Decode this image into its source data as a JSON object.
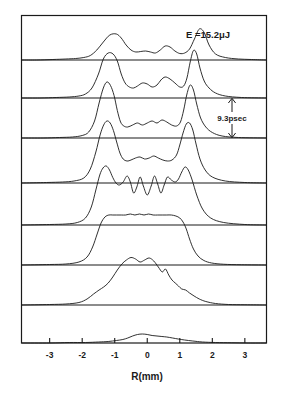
{
  "figure": {
    "energy_label": "E =15.2μJ",
    "interval_label": "9.3psec",
    "xaxis": {
      "title": "R(mm)",
      "ticks": [
        -3,
        -2,
        -1,
        0,
        1,
        2,
        3
      ],
      "tick_labels": [
        "-3",
        "-2",
        "-1",
        "0",
        "1",
        "2",
        "3"
      ],
      "range": [
        -3.85,
        3.65
      ]
    },
    "colors": {
      "ink": "#1a1a1a",
      "background": "#ffffff"
    }
  },
  "chart_data": {
    "type": "line",
    "title": "",
    "subtitle": "",
    "xlabel": "R(mm)",
    "ylabel": "",
    "xlim": [
      -3.85,
      3.65
    ],
    "grid": false,
    "legend": false,
    "annotations": [
      {
        "text": "E =15.2μJ",
        "x": 1.85,
        "y_panel": 0,
        "role": "pulse-energy"
      },
      {
        "text": "9.3psec",
        "x": 2.45,
        "y_panel": 2,
        "role": "frame-time-interval"
      }
    ],
    "panel_count": 8,
    "panel_note": "Eight stacked streak-camera time slices of a beam radial profile, each separated in time by 9.3 psec; top panel is earliest.",
    "series": [
      {
        "name": "t0 (earliest)",
        "panel": 1,
        "baseline_y": 60,
        "x": [
          -3.85,
          -3.4,
          -2.9,
          -2.5,
          -2.2,
          -1.95,
          -1.75,
          -1.55,
          -1.35,
          -1.15,
          -0.95,
          -0.8,
          -0.65,
          -0.5,
          -0.35,
          -0.2,
          -0.05,
          0.1,
          0.25,
          0.4,
          0.55,
          0.7,
          0.85,
          1.0,
          1.15,
          1.3,
          1.45,
          1.6,
          1.75,
          1.9,
          2.1,
          2.4,
          2.8,
          3.2,
          3.65
        ],
        "values": [
          0,
          0,
          0.01,
          0.02,
          0.03,
          0.05,
          0.09,
          0.2,
          0.36,
          0.5,
          0.52,
          0.44,
          0.3,
          0.2,
          0.16,
          0.17,
          0.18,
          0.16,
          0.14,
          0.2,
          0.28,
          0.26,
          0.18,
          0.13,
          0.14,
          0.22,
          0.42,
          0.62,
          0.55,
          0.3,
          0.12,
          0.05,
          0.02,
          0.01,
          0
        ]
      },
      {
        "name": "t0 + 9.3 psec",
        "panel": 2,
        "baseline_y": 98,
        "x": [
          -3.85,
          -3.3,
          -2.8,
          -2.4,
          -2.1,
          -1.9,
          -1.7,
          -1.5,
          -1.35,
          -1.2,
          -1.05,
          -0.92,
          -0.8,
          -0.68,
          -0.55,
          -0.42,
          -0.3,
          -0.15,
          0.0,
          0.15,
          0.3,
          0.42,
          0.55,
          0.7,
          0.85,
          1.0,
          1.12,
          1.22,
          1.32,
          1.42,
          1.52,
          1.62,
          1.75,
          1.9,
          2.1,
          2.4,
          2.9,
          3.65
        ],
        "values": [
          0,
          0,
          0.01,
          0.02,
          0.04,
          0.08,
          0.2,
          0.48,
          0.78,
          0.9,
          0.88,
          0.74,
          0.48,
          0.3,
          0.22,
          0.2,
          0.24,
          0.3,
          0.28,
          0.22,
          0.26,
          0.36,
          0.42,
          0.38,
          0.3,
          0.22,
          0.24,
          0.4,
          0.72,
          0.95,
          0.88,
          0.6,
          0.34,
          0.2,
          0.1,
          0.04,
          0.01,
          0
        ]
      },
      {
        "name": "t0 + 18.6 psec",
        "panel": 3,
        "baseline_y": 138,
        "x": [
          -3.85,
          -3.2,
          -2.7,
          -2.3,
          -2.0,
          -1.8,
          -1.62,
          -1.48,
          -1.35,
          -1.24,
          -1.13,
          -1.02,
          -0.92,
          -0.82,
          -0.72,
          -0.6,
          -0.45,
          -0.3,
          -0.15,
          0.0,
          0.15,
          0.3,
          0.45,
          0.6,
          0.75,
          0.9,
          1.02,
          1.12,
          1.22,
          1.32,
          1.42,
          1.52,
          1.64,
          1.8,
          2.0,
          2.3,
          2.8,
          3.65
        ],
        "values": [
          0,
          0,
          0.01,
          0.02,
          0.05,
          0.12,
          0.34,
          0.7,
          1.0,
          1.12,
          1.05,
          0.85,
          0.55,
          0.32,
          0.24,
          0.22,
          0.26,
          0.3,
          0.26,
          0.3,
          0.34,
          0.3,
          0.36,
          0.32,
          0.26,
          0.24,
          0.32,
          0.56,
          0.88,
          1.06,
          0.96,
          0.68,
          0.4,
          0.22,
          0.11,
          0.04,
          0.01,
          0
        ]
      },
      {
        "name": "t0 + 27.9 psec",
        "panel": 4,
        "baseline_y": 183,
        "x": [
          -3.85,
          -3.1,
          -2.6,
          -2.25,
          -1.95,
          -1.75,
          -1.58,
          -1.45,
          -1.34,
          -1.24,
          -1.14,
          -1.04,
          -0.94,
          -0.84,
          -0.74,
          -0.62,
          -0.5,
          -0.36,
          -0.22,
          -0.08,
          0.06,
          0.2,
          0.34,
          0.48,
          0.62,
          0.76,
          0.9,
          1.0,
          1.1,
          1.2,
          1.3,
          1.4,
          1.5,
          1.62,
          1.78,
          2.0,
          2.4,
          3.0,
          3.65
        ],
        "values": [
          0,
          0.01,
          0.02,
          0.04,
          0.1,
          0.28,
          0.62,
          0.96,
          1.16,
          1.24,
          1.2,
          1.05,
          0.82,
          0.6,
          0.48,
          0.44,
          0.46,
          0.5,
          0.52,
          0.48,
          0.5,
          0.54,
          0.5,
          0.46,
          0.44,
          0.46,
          0.56,
          0.76,
          1.0,
          1.18,
          1.2,
          1.06,
          0.78,
          0.48,
          0.26,
          0.12,
          0.04,
          0.01,
          0
        ]
      },
      {
        "name": "t0 + 37.2 psec",
        "panel": 5,
        "baseline_y": 225,
        "x": [
          -3.85,
          -3.0,
          -2.5,
          -2.15,
          -1.9,
          -1.72,
          -1.58,
          -1.46,
          -1.36,
          -1.26,
          -1.16,
          -1.06,
          -0.96,
          -0.86,
          -0.74,
          -0.62,
          -0.52,
          -0.42,
          -0.32,
          -0.22,
          -0.12,
          0.0,
          0.12,
          0.22,
          0.32,
          0.42,
          0.52,
          0.62,
          0.74,
          0.86,
          0.96,
          1.06,
          1.16,
          1.26,
          1.38,
          1.52,
          1.7,
          1.95,
          2.35,
          3.0,
          3.65
        ],
        "values": [
          0,
          0.01,
          0.02,
          0.05,
          0.14,
          0.36,
          0.7,
          1.0,
          1.14,
          1.18,
          1.1,
          0.95,
          0.84,
          0.8,
          0.86,
          0.98,
          0.86,
          0.64,
          0.76,
          0.96,
          0.78,
          0.6,
          0.78,
          0.98,
          0.82,
          0.64,
          0.8,
          0.96,
          0.9,
          0.86,
          0.92,
          1.06,
          1.16,
          1.1,
          0.9,
          0.6,
          0.32,
          0.14,
          0.05,
          0.01,
          0
        ]
      },
      {
        "name": "t0 + 46.5 psec",
        "panel": 6,
        "baseline_y": 265,
        "x": [
          -3.85,
          -3.0,
          -2.5,
          -2.1,
          -1.85,
          -1.68,
          -1.54,
          -1.42,
          -1.3,
          -1.18,
          -1.06,
          -0.94,
          -0.8,
          -0.66,
          -0.52,
          -0.38,
          -0.24,
          -0.1,
          0.04,
          0.18,
          0.32,
          0.46,
          0.6,
          0.74,
          0.88,
          1.0,
          1.1,
          1.2,
          1.3,
          1.42,
          1.56,
          1.74,
          1.98,
          2.35,
          2.9,
          3.65
        ],
        "values": [
          0,
          0.01,
          0.02,
          0.06,
          0.16,
          0.36,
          0.62,
          0.84,
          0.96,
          1.0,
          1.0,
          1.0,
          1.0,
          1.0,
          1.02,
          1.0,
          1.02,
          1.0,
          1.02,
          1.0,
          1.0,
          1.0,
          1.0,
          1.0,
          0.98,
          0.94,
          0.86,
          0.72,
          0.52,
          0.32,
          0.18,
          0.09,
          0.04,
          0.015,
          0.005,
          0
        ]
      },
      {
        "name": "t0 + 55.8 psec",
        "panel": 7,
        "baseline_y": 305,
        "x": [
          -3.85,
          -3.0,
          -2.5,
          -2.1,
          -1.85,
          -1.65,
          -1.48,
          -1.34,
          -1.2,
          -1.06,
          -0.92,
          -0.78,
          -0.64,
          -0.5,
          -0.36,
          -0.22,
          -0.08,
          0.06,
          0.2,
          0.34,
          0.46,
          0.56,
          0.66,
          0.76,
          0.86,
          0.96,
          1.06,
          1.18,
          1.3,
          1.44,
          1.6,
          1.8,
          2.1,
          2.5,
          3.0,
          3.65
        ],
        "values": [
          0,
          0.01,
          0.02,
          0.05,
          0.12,
          0.22,
          0.3,
          0.36,
          0.44,
          0.56,
          0.7,
          0.82,
          0.9,
          0.95,
          0.92,
          0.86,
          0.9,
          0.94,
          0.88,
          0.76,
          0.66,
          0.72,
          0.6,
          0.5,
          0.44,
          0.38,
          0.32,
          0.3,
          0.24,
          0.18,
          0.12,
          0.07,
          0.03,
          0.01,
          0.005,
          0
        ]
      },
      {
        "name": "t0 + 65.1 psec (latest)",
        "panel": 8,
        "baseline_y": 343,
        "x": [
          -3.85,
          -3.0,
          -2.4,
          -1.9,
          -1.5,
          -1.2,
          -0.95,
          -0.75,
          -0.6,
          -0.45,
          -0.3,
          -0.15,
          0.0,
          0.15,
          0.3,
          0.45,
          0.6,
          0.78,
          0.95,
          1.15,
          1.4,
          1.7,
          2.1,
          2.6,
          3.1,
          3.65
        ],
        "values": [
          0,
          0,
          0.01,
          0.01,
          0.02,
          0.03,
          0.05,
          0.07,
          0.1,
          0.14,
          0.17,
          0.18,
          0.17,
          0.15,
          0.14,
          0.13,
          0.12,
          0.1,
          0.08,
          0.06,
          0.04,
          0.02,
          0.01,
          0.005,
          0,
          0
        ]
      }
    ]
  }
}
